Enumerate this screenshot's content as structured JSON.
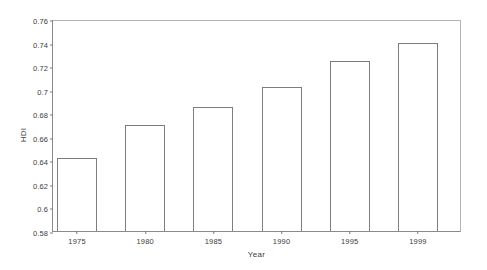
{
  "chart_data": {
    "type": "bar",
    "title": "",
    "xlabel": "Year",
    "ylabel": "HDI",
    "categories": [
      "1975",
      "1980",
      "1985",
      "1990",
      "1995",
      "1999"
    ],
    "values": [
      0.642,
      0.67,
      0.685,
      0.702,
      0.724,
      0.74
    ],
    "ylim": [
      0.58,
      0.76
    ],
    "ytick_step": 0.02,
    "ytick_labels": [
      "0.58",
      "0.6",
      "0.62",
      "0.64",
      "0.66",
      "0.68",
      "0.7",
      "0.72",
      "0.74",
      "0.76"
    ],
    "ytick_values": [
      0.58,
      0.6,
      0.62,
      0.64,
      0.66,
      0.68,
      0.7,
      0.72,
      0.74,
      0.76
    ],
    "grid": false,
    "legend": false,
    "bar_fill_color": "#ffffff",
    "bar_border_color": "#7d7d7d",
    "axis_color": "#8a8a8a",
    "text_color": "#3c3c3c",
    "background_color": "#ffffff"
  }
}
